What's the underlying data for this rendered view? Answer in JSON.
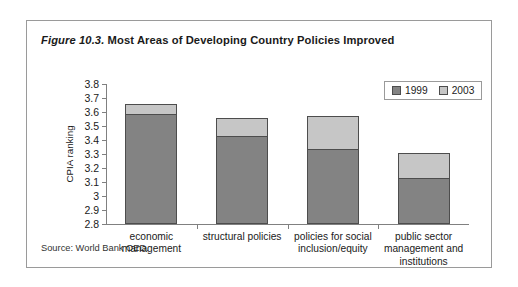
{
  "figure": {
    "label": "Figure 10.3.",
    "caption": "Most Areas of Developing Country Policies Improved",
    "source": "Source: World Bank OED."
  },
  "legend": {
    "entries": [
      {
        "label": "1999",
        "color": "#838383"
      },
      {
        "label": "2003",
        "color": "#c6c6c6"
      }
    ]
  },
  "axis": {
    "y_title": "CPIA ranking",
    "y_ticks": [
      "3.8",
      "3.7",
      "3.6",
      "3.5",
      "3.4",
      "3.3",
      "3.2",
      "3.1",
      "3",
      "2.9",
      "2.8"
    ]
  },
  "chart_data": {
    "type": "bar",
    "title": "Most Areas of Developing Country Policies Improved",
    "subtitle": "Figure 10.3.",
    "xlabel": "",
    "ylabel": "CPIA ranking",
    "ylim": [
      2.8,
      3.8
    ],
    "ytick_step": 0.1,
    "grid": false,
    "stacked_overlay": true,
    "legend_position": "top-right",
    "categories": [
      "economic management",
      "structural policies",
      "policies for social inclusion/equity",
      "public sector management and institutions"
    ],
    "series": [
      {
        "name": "1999",
        "color": "#838383",
        "values": [
          3.58,
          3.42,
          3.33,
          3.12
        ]
      },
      {
        "name": "2003",
        "color": "#c6c6c6",
        "values": [
          3.66,
          3.56,
          3.57,
          3.31
        ]
      }
    ],
    "annotations": [
      "Source: World Bank OED."
    ]
  }
}
